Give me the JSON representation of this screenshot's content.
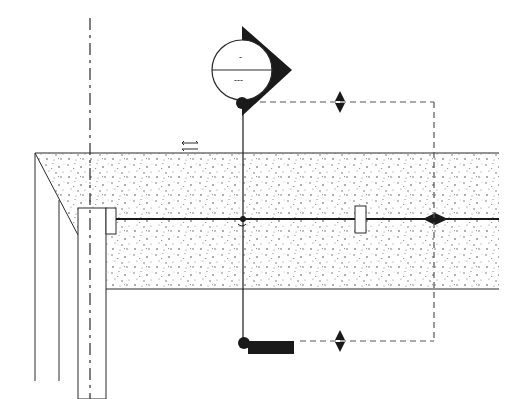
{
  "drawing": {
    "type": "architectural section detail",
    "colors": {
      "line": "#2a2a2a",
      "stipple": "#555555",
      "fill_dark": "#1a1a1a",
      "background": "#ffffff"
    },
    "section_marker": {
      "icon": "section-callout-icon",
      "upper_text": "-",
      "lower_text": "---",
      "center": [
        242,
        70
      ],
      "radius": 30
    },
    "level_markers": [
      {
        "icon": "elevation-arrow-icon",
        "position": [
          340,
          102
        ]
      },
      {
        "icon": "elevation-arrow-icon",
        "position": [
          340,
          341
        ]
      }
    ],
    "grid_line": {
      "x": 90,
      "style": "dash-dot"
    },
    "slab": {
      "top_y": 153,
      "bottom_y": 289,
      "left_x": 35,
      "right_x": 499,
      "material": "concrete-stipple"
    },
    "reinforcement_line_y": 219,
    "direction_symbol": {
      "icon": "bidirectional-arrow-icon",
      "position": [
        190,
        146
      ]
    },
    "dimension_tag": {
      "icon": "filled-tag-icon",
      "position": [
        245,
        346
      ]
    }
  }
}
